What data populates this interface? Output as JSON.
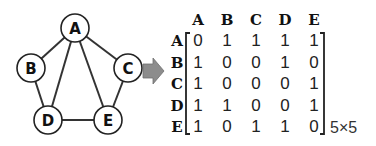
{
  "graph": {
    "nodes": [
      {
        "id": "A",
        "label": "A",
        "x": 75,
        "y": 28
      },
      {
        "id": "B",
        "label": "B",
        "x": 31,
        "y": 68
      },
      {
        "id": "C",
        "label": "C",
        "x": 128,
        "y": 68
      },
      {
        "id": "D",
        "label": "D",
        "x": 48,
        "y": 120
      },
      {
        "id": "E",
        "label": "E",
        "x": 108,
        "y": 120
      }
    ],
    "edges": [
      [
        "A",
        "B"
      ],
      [
        "A",
        "C"
      ],
      [
        "A",
        "D"
      ],
      [
        "A",
        "E"
      ],
      [
        "B",
        "D"
      ],
      [
        "C",
        "E"
      ],
      [
        "D",
        "E"
      ]
    ],
    "node_radius": 14,
    "colors": {
      "edge": "#333333",
      "node_stroke": "#222222",
      "node_fill": "#ffffff"
    }
  },
  "arrow": {
    "icon": "right-arrow-icon",
    "color": "#8c8c8c"
  },
  "matrix": {
    "column_headers": [
      "A",
      "B",
      "C",
      "D",
      "E"
    ],
    "row_headers": [
      "A",
      "B",
      "C",
      "D",
      "E"
    ],
    "values": [
      [
        0,
        1,
        1,
        1,
        1
      ],
      [
        1,
        0,
        0,
        1,
        0
      ],
      [
        1,
        0,
        0,
        0,
        1
      ],
      [
        1,
        1,
        0,
        0,
        1
      ],
      [
        1,
        0,
        1,
        1,
        0
      ]
    ],
    "dimensions_label": "5×5"
  }
}
